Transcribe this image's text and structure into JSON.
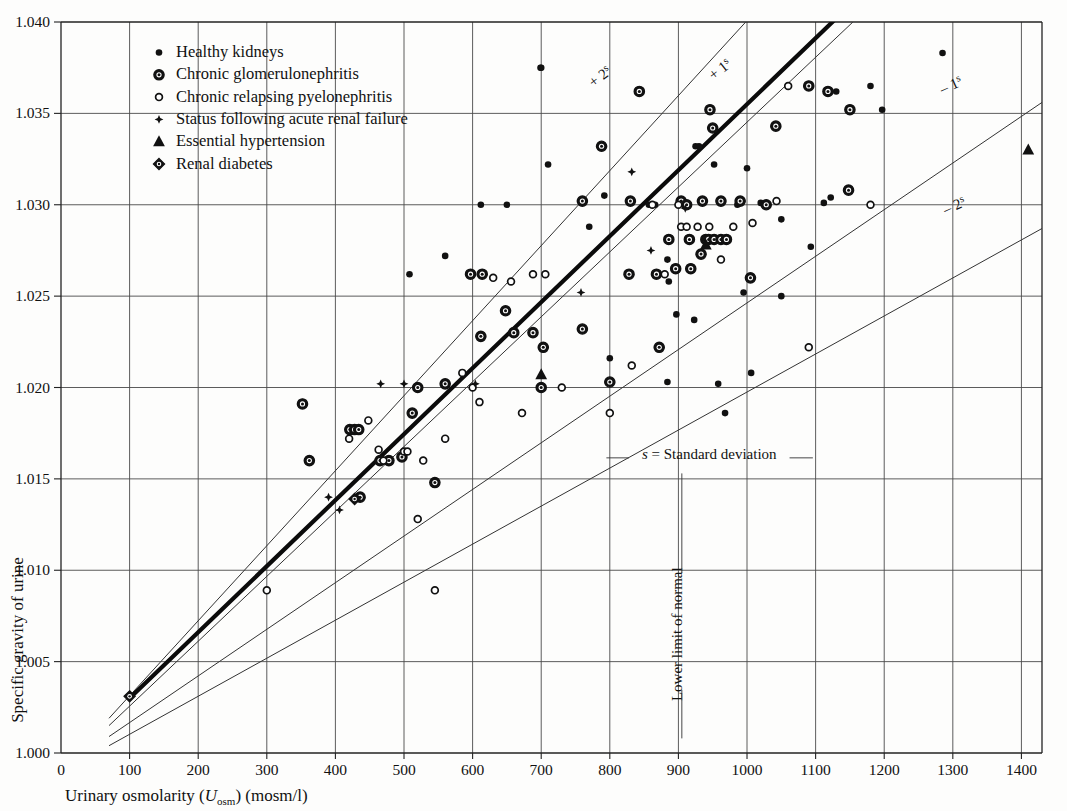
{
  "chart_data": {
    "type": "scatter",
    "title": "",
    "xlabel": "Urinary osmolarity (Uosm) (mosm/l)",
    "xlabel_parts": {
      "main": "Urinary osmolarity (",
      "italic": "U",
      "sub": "osm",
      "tail": ") (mosm/l)"
    },
    "ylabel": "Specific gravity of urine",
    "xlim": [
      0,
      1430
    ],
    "ylim": [
      1.0,
      1.04
    ],
    "xticks": [
      0,
      100,
      200,
      300,
      400,
      500,
      600,
      700,
      800,
      900,
      1000,
      1100,
      1200,
      1300,
      1400
    ],
    "xtick_labels": [
      "0",
      "100",
      "200",
      "300",
      "400",
      "500",
      "600",
      "700",
      "800",
      "900",
      "1000",
      "1100",
      "1200",
      "1300",
      "1400"
    ],
    "yticks": [
      1.0,
      1.005,
      1.01,
      1.015,
      1.02,
      1.025,
      1.03,
      1.035,
      1.04
    ],
    "ytick_labels": [
      "1.000",
      "1.005",
      "1.010",
      "1.015",
      "1.020",
      "1.025",
      "1.030",
      "1.035",
      "1.040"
    ],
    "grid": true,
    "grid_x_every": 100,
    "grid_y_every": 0.005,
    "legend_position": "top-left-inside",
    "annotations": [
      {
        "id": "plus-2s",
        "text": "+ 2",
        "sup": "s",
        "x": 790,
        "y": 1.0368,
        "rotate": -38
      },
      {
        "id": "plus-1s",
        "text": "+ 1",
        "sup": "s",
        "x": 965,
        "y": 1.0372,
        "rotate": -38
      },
      {
        "id": "minus-1s",
        "text": "– 1",
        "sup": "s",
        "x": 1300,
        "y": 1.0363,
        "rotate": -24
      },
      {
        "id": "minus-2s",
        "text": "– 2",
        "sup": "s",
        "x": 1305,
        "y": 1.0297,
        "rotate": -24
      },
      {
        "id": "sd-note",
        "text": "s = Standard deviation",
        "x": 945,
        "y": 1.0161,
        "rotate": 0
      },
      {
        "id": "lower-limit",
        "text": "Lower limit of normal",
        "x": 905,
        "y": 1.0065,
        "rotate": -90
      }
    ],
    "regression_line": {
      "name": "Regression line",
      "x": [
        100,
        1130
      ],
      "y": [
        1.003,
        1.0402
      ]
    },
    "sd_lines": [
      {
        "name": "+2s",
        "x": [
          70,
          1003
        ],
        "y": [
          1.0019,
          1.0402
        ]
      },
      {
        "name": "+1s",
        "x": [
          70,
          1160
        ],
        "y": [
          1.0015,
          1.0402
        ]
      },
      {
        "name": "-1s",
        "x": [
          70,
          1430
        ],
        "y": [
          1.0009,
          1.0356
        ]
      },
      {
        "name": "-2s",
        "x": [
          70,
          1430
        ],
        "y": [
          1.0004,
          1.0287
        ]
      }
    ],
    "series": [
      {
        "name": "Healthy kidneys",
        "marker": "small-dot",
        "points": [
          [
            699,
            1.0375
          ],
          [
            700,
            1.0375
          ],
          [
            710,
            1.0322
          ],
          [
            1180,
            1.0365
          ],
          [
            1000,
            1.032
          ],
          [
            792,
            1.0305
          ],
          [
            1050,
            1.0292
          ],
          [
            857,
            1.03
          ],
          [
            866,
            1.03
          ],
          [
            925,
            1.0332
          ],
          [
            930,
            1.0332
          ],
          [
            952,
            1.0322
          ],
          [
            986,
            1.03
          ],
          [
            1020,
            1.0301
          ],
          [
            1112,
            1.0301
          ],
          [
            1122,
            1.0304
          ],
          [
            884,
            1.027
          ],
          [
            886,
            1.0258
          ],
          [
            995,
            1.0252
          ],
          [
            1050,
            1.025
          ],
          [
            897,
            1.024
          ],
          [
            923,
            1.0237
          ],
          [
            1006,
            1.0208
          ],
          [
            958,
            1.0202
          ],
          [
            884,
            1.0203
          ],
          [
            800,
            1.0216
          ],
          [
            968,
            1.0186
          ],
          [
            1093,
            1.0277
          ],
          [
            1130,
            1.0362
          ],
          [
            1197,
            1.0352
          ],
          [
            1285,
            1.0383
          ],
          [
            560,
            1.0272
          ],
          [
            612,
            1.03
          ],
          [
            650,
            1.03
          ],
          [
            770,
            1.0288
          ],
          [
            508,
            1.0262
          ]
        ]
      },
      {
        "name": "Chronic glomerulonephritis",
        "marker": "ring-dot",
        "points": [
          [
            352,
            1.0191
          ],
          [
            362,
            1.016
          ],
          [
            421,
            1.0177
          ],
          [
            428,
            1.0177
          ],
          [
            434,
            1.0177
          ],
          [
            465,
            1.016
          ],
          [
            478,
            1.016
          ],
          [
            497,
            1.0162
          ],
          [
            512,
            1.0186
          ],
          [
            520,
            1.02
          ],
          [
            545,
            1.0148
          ],
          [
            560,
            1.0202
          ],
          [
            597,
            1.0262
          ],
          [
            612,
            1.0228
          ],
          [
            614,
            1.0262
          ],
          [
            648,
            1.0242
          ],
          [
            660,
            1.023
          ],
          [
            688,
            1.023
          ],
          [
            700,
            1.02
          ],
          [
            703,
            1.0222
          ],
          [
            760,
            1.0232
          ],
          [
            800,
            1.0203
          ],
          [
            828,
            1.0262
          ],
          [
            868,
            1.0262
          ],
          [
            886,
            1.0281
          ],
          [
            904,
            1.0302
          ],
          [
            912,
            1.03
          ],
          [
            916,
            1.0281
          ],
          [
            935,
            1.0302
          ],
          [
            940,
            1.0281
          ],
          [
            944,
            1.0281
          ],
          [
            952,
            1.0281
          ],
          [
            962,
            1.0281
          ],
          [
            970,
            1.0281
          ],
          [
            933,
            1.0273
          ],
          [
            946,
            1.0352
          ],
          [
            950,
            1.0342
          ],
          [
            962,
            1.0302
          ],
          [
            990,
            1.0302
          ],
          [
            1005,
            1.026
          ],
          [
            1028,
            1.03
          ],
          [
            1042,
            1.0343
          ],
          [
            1090,
            1.0365
          ],
          [
            1118,
            1.0362
          ],
          [
            1150,
            1.0352
          ],
          [
            918,
            1.0265
          ],
          [
            896,
            1.0265
          ],
          [
            872,
            1.0222
          ],
          [
            436,
            1.014
          ],
          [
            760,
            1.0302
          ],
          [
            788,
            1.0332
          ],
          [
            830,
            1.0302
          ],
          [
            843,
            1.0362
          ],
          [
            1148,
            1.0308
          ]
        ]
      },
      {
        "name": "Chronic relapsing pyelonephritis",
        "marker": "open-circle",
        "points": [
          [
            300,
            1.0089
          ],
          [
            420,
            1.0172
          ],
          [
            448,
            1.0182
          ],
          [
            463,
            1.0166
          ],
          [
            470,
            1.016
          ],
          [
            500,
            1.0165
          ],
          [
            505,
            1.0165
          ],
          [
            520,
            1.0128
          ],
          [
            545,
            1.0089
          ],
          [
            560,
            1.0172
          ],
          [
            585,
            1.0208
          ],
          [
            600,
            1.02
          ],
          [
            630,
            1.026
          ],
          [
            656,
            1.0258
          ],
          [
            672,
            1.0186
          ],
          [
            688,
            1.0262
          ],
          [
            706,
            1.0262
          ],
          [
            730,
            1.02
          ],
          [
            800,
            1.0186
          ],
          [
            832,
            1.0212
          ],
          [
            862,
            1.03
          ],
          [
            880,
            1.0262
          ],
          [
            900,
            1.03
          ],
          [
            904,
            1.0288
          ],
          [
            912,
            1.0288
          ],
          [
            928,
            1.0288
          ],
          [
            945,
            1.0288
          ],
          [
            962,
            1.027
          ],
          [
            980,
            1.0288
          ],
          [
            1008,
            1.029
          ],
          [
            1043,
            1.0302
          ],
          [
            1060,
            1.0365
          ],
          [
            1090,
            1.0222
          ],
          [
            528,
            1.016
          ],
          [
            610,
            1.0192
          ],
          [
            1180,
            1.03
          ]
        ]
      },
      {
        "name": "Status following acute renal failure",
        "marker": "star",
        "points": [
          [
            390,
            1.014
          ],
          [
            406,
            1.0133
          ],
          [
            432,
            1.014
          ],
          [
            466,
            1.0202
          ],
          [
            500,
            1.0202
          ],
          [
            604,
            1.0202
          ],
          [
            758,
            1.0252
          ],
          [
            832,
            1.0318
          ],
          [
            910,
            1.0298
          ],
          [
            860,
            1.0275
          ]
        ]
      },
      {
        "name": "Essential hypertension",
        "marker": "triangle",
        "points": [
          [
            700,
            1.0207
          ],
          [
            940,
            1.0278
          ],
          [
            1410,
            1.033
          ]
        ]
      },
      {
        "name": "Renal diabetes",
        "marker": "diamond-dot",
        "points": [
          [
            100,
            1.0031
          ],
          [
            428,
            1.0139
          ]
        ]
      }
    ]
  },
  "legend": {
    "items": [
      {
        "marker": "small-dot",
        "label": "Healthy kidneys"
      },
      {
        "marker": "ring-dot",
        "label": "Chronic glomerulonephritis"
      },
      {
        "marker": "open-circle",
        "label": "Chronic relapsing pyelonephritis"
      },
      {
        "marker": "star",
        "label": "Status following acute renal failure"
      },
      {
        "marker": "triangle",
        "label": "Essential hypertension"
      },
      {
        "marker": "diamond-dot",
        "label": "Renal diabetes"
      }
    ]
  },
  "colors": {
    "ink": "#111111",
    "grid": "#4a4a4a",
    "background": "#fdfdfc"
  }
}
